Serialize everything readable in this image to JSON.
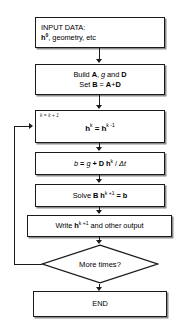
{
  "diagram": {
    "type": "flowchart",
    "orientation": "vertical",
    "colors": {
      "stroke": "#1a1a1a",
      "fill": "#ffffff",
      "shadow": "#8c8c8c",
      "text": "#000000"
    },
    "nodes": {
      "input": {
        "shape": "rectangle",
        "align": "left",
        "line1": "INPUT DATA:",
        "line2_prefix": "h",
        "line2_sup": "0",
        "line2_suffix": ", geometry, etc"
      },
      "build": {
        "shape": "rectangle",
        "align": "center",
        "line1_a": "Build ",
        "line1_b": "A",
        "line1_c": ", ",
        "line1_d": "g",
        "line1_e": " and ",
        "line1_f": "D",
        "line2_a": "Set ",
        "line2_b": "B",
        "line2_c": " = ",
        "line2_d": "A",
        "line2_e": "+",
        "line2_f": "D"
      },
      "iterate": {
        "shape": "rectangle",
        "counter": "k = k + 1",
        "eq_lhs": "h",
        "eq_lhs_sup": "k",
        "eq_op": " = ",
        "eq_rhs": "h",
        "eq_rhs_sup": "k -1"
      },
      "rhs": {
        "shape": "rectangle",
        "t1": "b",
        "t2": " = ",
        "t3": "g",
        "t4": " + ",
        "t5": "D h",
        "t5_sup": "k",
        "t6": " / ",
        "t7": "Δt"
      },
      "solve": {
        "shape": "rectangle",
        "t1": "Solve ",
        "t2": "B h",
        "t2_sup": "k +1",
        "t3": " = ",
        "t4": "b"
      },
      "write": {
        "shape": "rectangle",
        "t1": "Write ",
        "t2": "h",
        "t2_sup": "k +1",
        "t3": " and other output"
      },
      "decision": {
        "shape": "diamond",
        "label": "More times?"
      },
      "end": {
        "shape": "rectangle",
        "label": "END"
      }
    },
    "edges": [
      {
        "from": "input",
        "to": "build",
        "style": "arrow-down"
      },
      {
        "from": "build",
        "to": "iterate",
        "style": "arrow-down"
      },
      {
        "from": "iterate",
        "to": "rhs",
        "style": "arrow-down"
      },
      {
        "from": "rhs",
        "to": "solve",
        "style": "arrow-down"
      },
      {
        "from": "solve",
        "to": "write",
        "style": "arrow-down"
      },
      {
        "from": "write",
        "to": "decision",
        "style": "arrow-down"
      },
      {
        "from": "decision",
        "to": "end",
        "style": "arrow-down"
      },
      {
        "from": "decision",
        "to": "iterate",
        "style": "feedback-loop-left"
      }
    ]
  }
}
